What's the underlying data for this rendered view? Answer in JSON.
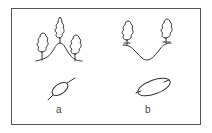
{
  "diagram": {
    "panels": [
      {
        "id": "a",
        "label": "a",
        "profile": "ridge",
        "trees": 3,
        "symbol": "small ellipse with line through"
      },
      {
        "id": "b",
        "label": "b",
        "profile": "valley",
        "trees": 2,
        "symbol": "elongated ellipse with inner ticks"
      }
    ],
    "colors": {
      "line": "#333333",
      "frame": "#555555",
      "background": "#ffffff"
    }
  }
}
